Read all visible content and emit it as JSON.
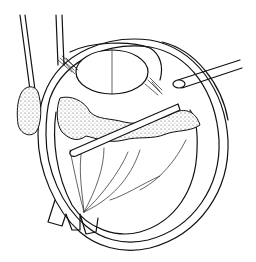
{
  "figure": {
    "style": "black-and-white line drawing",
    "colors": {
      "line": "#111111",
      "background": "#ffffff"
    },
    "elements": [
      "sclera-outer-wall",
      "lens",
      "ciliary-body",
      "retina-with-vessels",
      "optic-nerve",
      "vitreous-base-stippled",
      "surgical-probe-left-1",
      "surgical-probe-left-2",
      "sponge-tip",
      "intraocular-instrument",
      "external-cannula-right"
    ]
  }
}
